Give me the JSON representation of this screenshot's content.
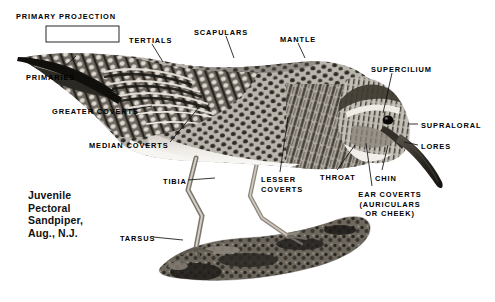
{
  "figure": {
    "caption": "Juvenile\nPectoral\nSandpiper,\nAug., N.J.",
    "caption_lines": [
      "Juvenile",
      "Pectoral",
      "Sandpiper,",
      "Aug., N.J."
    ],
    "background_color": "#ffffff",
    "label_color": "#000000",
    "leader_color": "#111111",
    "subject": "Juvenile Pectoral Sandpiper"
  },
  "labels": [
    {
      "id": "primary-projection",
      "text": "PRIMARY PROJECTION",
      "x": 16,
      "y": 12,
      "align": "left"
    },
    {
      "id": "primaries",
      "text": "PRIMARIES",
      "x": 26,
      "y": 73,
      "align": "left"
    },
    {
      "id": "tertials",
      "text": "TERTIALS",
      "x": 129,
      "y": 36,
      "align": "left"
    },
    {
      "id": "scapulars",
      "text": "SCAPULARS",
      "x": 194,
      "y": 28,
      "align": "left"
    },
    {
      "id": "mantle",
      "text": "MANTLE",
      "x": 280,
      "y": 35,
      "align": "left"
    },
    {
      "id": "greater-coverts",
      "text": "GREATER COVERTS",
      "x": 52,
      "y": 107,
      "align": "left"
    },
    {
      "id": "median-coverts",
      "text": "MEDIAN COVERTS",
      "x": 89,
      "y": 141,
      "align": "left"
    },
    {
      "id": "tibia",
      "text": "TIBIA",
      "x": 163,
      "y": 177,
      "align": "left"
    },
    {
      "id": "tarsus",
      "text": "TARSUS",
      "x": 120,
      "y": 234,
      "align": "left"
    },
    {
      "id": "lesser-coverts",
      "text": "LESSER\nCOVERTS",
      "x": 261,
      "y": 175,
      "align": "left"
    },
    {
      "id": "throat",
      "text": "THROAT",
      "x": 320,
      "y": 173,
      "align": "left"
    },
    {
      "id": "chin",
      "text": "CHIN",
      "x": 375,
      "y": 174,
      "align": "left"
    },
    {
      "id": "ear-coverts",
      "text": "EAR COVERTS\n(AURICULARS\nOR CHEEK)",
      "x": 390,
      "y": 190,
      "align": "center"
    },
    {
      "id": "supercilium",
      "text": "SUPERCILIUM",
      "x": 371,
      "y": 65,
      "align": "left"
    },
    {
      "id": "supraloral",
      "text": "SUPRALORAL",
      "x": 421,
      "y": 121,
      "align": "left"
    },
    {
      "id": "lores",
      "text": "LORES",
      "x": 421,
      "y": 142,
      "align": "left"
    }
  ],
  "bracket": {
    "id": "primary-projection-bracket",
    "x": 46,
    "y": 26,
    "width": 73,
    "height": 16
  },
  "leaders": [
    {
      "id": "leader-primaries",
      "from": [
        60,
        71
      ],
      "to": [
        76,
        56
      ]
    },
    {
      "id": "leader-tertials",
      "from": [
        152,
        44
      ],
      "to": [
        163,
        62
      ]
    },
    {
      "id": "leader-scapulars",
      "from": [
        226,
        36
      ],
      "to": [
        234,
        58
      ]
    },
    {
      "id": "leader-mantle",
      "from": [
        298,
        43
      ],
      "to": [
        305,
        58
      ]
    },
    {
      "id": "leader-greater-coverts",
      "from": [
        130,
        110
      ],
      "to": [
        152,
        106
      ]
    },
    {
      "id": "leader-median-coverts",
      "from": [
        170,
        142
      ],
      "to": [
        200,
        106
      ]
    },
    {
      "id": "leader-tibia",
      "from": [
        188,
        180
      ],
      "to": [
        215,
        178
      ]
    },
    {
      "id": "leader-tarsus",
      "from": [
        153,
        237
      ],
      "to": [
        183,
        240
      ]
    },
    {
      "id": "leader-lesser-coverts",
      "from": [
        280,
        172
      ],
      "to": [
        288,
        117
      ]
    },
    {
      "id": "leader-throat",
      "from": [
        337,
        170
      ],
      "to": [
        355,
        145
      ]
    },
    {
      "id": "leader-chin",
      "from": [
        382,
        170
      ],
      "to": [
        388,
        145
      ]
    },
    {
      "id": "leader-ear-coverts",
      "from": [
        372,
        186
      ],
      "to": [
        366,
        143
      ]
    },
    {
      "id": "leader-supercilium",
      "from": [
        392,
        73
      ],
      "to": [
        383,
        113
      ]
    },
    {
      "id": "leader-supraloral",
      "from": [
        418,
        124
      ],
      "to": [
        408,
        124
      ]
    },
    {
      "id": "leader-lores",
      "from": [
        418,
        145
      ],
      "to": [
        404,
        142
      ]
    }
  ],
  "subject_parts": [
    "primary projection",
    "primaries",
    "tertials",
    "scapulars",
    "mantle",
    "greater coverts",
    "median coverts",
    "lesser coverts",
    "tibia",
    "tarsus",
    "throat",
    "chin",
    "ear coverts",
    "supercilium",
    "supraloral",
    "lores"
  ]
}
